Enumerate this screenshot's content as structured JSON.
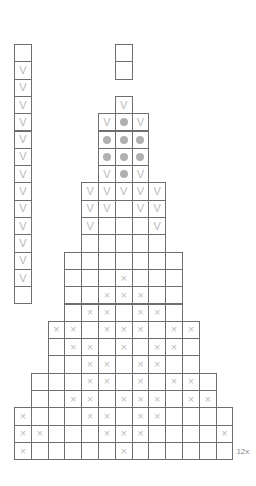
{
  "chart_data": {
    "type": "table",
    "title": "",
    "grid": {
      "columns": 13,
      "rows": 25,
      "cell_width": 16.8,
      "cell_height": 17.3,
      "origin_x": 14,
      "origin_y": 44
    },
    "symbols": {
      "v": "V",
      "x": "×",
      "dot": "●",
      "empty": ""
    },
    "legend_entries": [
      {
        "symbol": "V",
        "name": "v-stitch"
      },
      {
        "symbol": "●",
        "name": "dot-stitch"
      },
      {
        "symbol": "×",
        "name": "x-stitch"
      },
      {
        "symbol": "",
        "name": "blank-stitch"
      }
    ],
    "rows": [
      {
        "index": 0,
        "start_col": 6,
        "end_col": 6,
        "cells": [
          ""
        ]
      },
      {
        "index": 1,
        "start_col": 6,
        "end_col": 6,
        "cells": [
          ""
        ]
      },
      {
        "index": 2,
        "start_col": 0,
        "end_col": 0,
        "cells": [
          ""
        ]
      },
      {
        "index": 3,
        "start_col": 6,
        "end_col": 6,
        "cells": [
          "V"
        ]
      },
      {
        "index": 4,
        "start_col": 5,
        "end_col": 7,
        "cells": [
          "V",
          "●",
          "V"
        ]
      },
      {
        "index": 5,
        "start_col": 5,
        "end_col": 7,
        "cells": [
          "●",
          "●",
          "●"
        ]
      },
      {
        "index": 6,
        "start_col": 5,
        "end_col": 7,
        "cells": [
          "●",
          "●",
          "●"
        ]
      },
      {
        "index": 7,
        "start_col": 5,
        "end_col": 7,
        "cells": [
          "V",
          "●",
          "V"
        ]
      },
      {
        "index": 8,
        "start_col": 4,
        "end_col": 8,
        "cells": [
          "V",
          "V",
          "V",
          "V",
          "V"
        ]
      },
      {
        "index": 9,
        "start_col": 4,
        "end_col": 8,
        "cells": [
          "V",
          "V",
          "",
          "V",
          "V"
        ]
      },
      {
        "index": 10,
        "start_col": 4,
        "end_col": 8,
        "cells": [
          "V",
          "",
          "",
          "",
          "V"
        ]
      },
      {
        "index": 11,
        "start_col": 4,
        "end_col": 8,
        "cells": [
          "",
          "",
          "",
          "",
          ""
        ]
      },
      {
        "index": 12,
        "start_col": 3,
        "end_col": 9,
        "cells": [
          "",
          "",
          "",
          "",
          "",
          "",
          ""
        ]
      },
      {
        "index": 13,
        "start_col": 3,
        "end_col": 9,
        "cells": [
          "",
          "",
          "",
          "×",
          "",
          "",
          ""
        ]
      },
      {
        "index": 14,
        "start_col": 3,
        "end_col": 9,
        "cells": [
          "",
          "",
          "×",
          "×",
          "×",
          "",
          ""
        ]
      },
      {
        "index": 15,
        "start_col": 3,
        "end_col": 9,
        "cells": [
          "",
          "×",
          "×",
          "",
          "×",
          "×",
          ""
        ]
      },
      {
        "index": 16,
        "start_col": 2,
        "end_col": 10,
        "cells": [
          "×",
          "×",
          "",
          "×",
          "×",
          "×",
          "",
          "×",
          "×"
        ]
      },
      {
        "index": 17,
        "start_col": 2,
        "end_col": 10,
        "cells": [
          "",
          "×",
          "×",
          "",
          "×",
          "",
          "×",
          "×",
          ""
        ]
      },
      {
        "index": 18,
        "start_col": 2,
        "end_col": 10,
        "cells": [
          "",
          "",
          "×",
          "×",
          "",
          "×",
          "×",
          "",
          ""
        ]
      },
      {
        "index": 19,
        "start_col": 1,
        "end_col": 11,
        "cells": [
          "",
          "",
          "",
          "×",
          "×",
          "",
          "×",
          "",
          "×",
          "×",
          ""
        ]
      },
      {
        "index": 20,
        "start_col": 1,
        "end_col": 11,
        "cells": [
          "",
          "",
          "×",
          "×",
          "",
          "×",
          "×",
          "×",
          "",
          "×",
          "×"
        ]
      },
      {
        "index": 21,
        "start_col": 0,
        "end_col": 12,
        "cells": [
          "×",
          "",
          "",
          "",
          "×",
          "×",
          "",
          "×",
          "×",
          "",
          "",
          "",
          ""
        ]
      },
      {
        "index": 22,
        "start_col": 0,
        "end_col": 12,
        "cells": [
          "×",
          "×",
          "",
          "",
          "",
          "×",
          "×",
          "×",
          "",
          "",
          "",
          "",
          "×"
        ]
      },
      {
        "index": 23,
        "start_col": 0,
        "end_col": 12,
        "cells": [
          "×",
          "",
          "",
          "",
          "",
          "",
          "×",
          "",
          "",
          "",
          "",
          "",
          ""
        ]
      }
    ],
    "left_column": {
      "col": 0,
      "start_row": 0,
      "cells": [
        "",
        "V",
        "V",
        "V",
        "V",
        "V",
        "V",
        "V",
        "V",
        "V",
        "V",
        "V",
        "V",
        "V",
        ""
      ]
    },
    "repeat_label": "12x"
  }
}
